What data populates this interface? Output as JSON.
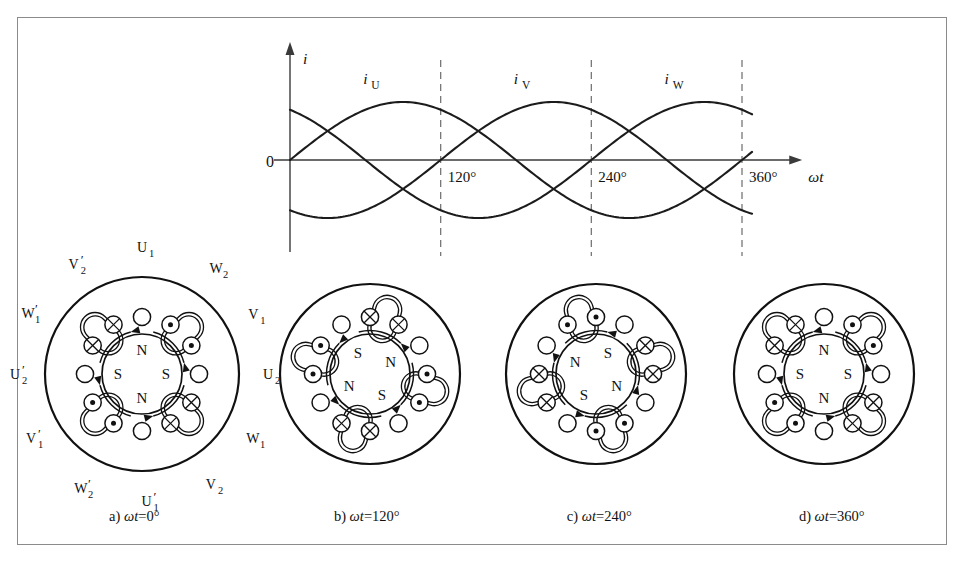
{
  "figure": {
    "border_color": "#8b8b8b",
    "background": "#ffffff"
  },
  "chart_data": {
    "type": "line",
    "title": "",
    "xlabel": "ωt",
    "ylabel": "i",
    "origin_label": "0",
    "xlim": [
      -30,
      390
    ],
    "ylim": [
      -1.25,
      1.25
    ],
    "grid": false,
    "legend": "inline-curve-labels",
    "xticks": [
      120,
      240,
      360
    ],
    "xtick_labels": [
      "120°",
      "240°",
      "360°"
    ],
    "dashed_verticals": [
      120,
      240,
      360
    ],
    "series": [
      {
        "name": "i_U",
        "label": "i",
        "label_sub": "U",
        "phase_deg": 0,
        "amplitude": 1,
        "label_at_deg": 60,
        "peak_deg": 90
      },
      {
        "name": "i_V",
        "label": "i",
        "label_sub": "V",
        "phase_deg": -120,
        "amplitude": 1,
        "label_at_deg": 180,
        "peak_deg": 210
      },
      {
        "name": "i_W",
        "label": "i",
        "label_sub": "W",
        "phase_deg": -240,
        "amplitude": 1,
        "label_at_deg": 300,
        "peak_deg": 330
      }
    ],
    "curve_start_values": {
      "i_U": 0.0,
      "i_V": 0.5,
      "i_W": -0.87
    }
  },
  "stators": [
    {
      "id": "a",
      "caption_prefix": "a)",
      "caption_var": "ωt",
      "caption_value": "=0°",
      "show_winding_labels": true,
      "poles": [
        {
          "letter": "N",
          "angle_deg": 90
        },
        {
          "letter": "S",
          "angle_deg": 180
        },
        {
          "letter": "N",
          "angle_deg": 270
        },
        {
          "letter": "S",
          "angle_deg": 0
        }
      ],
      "slots": [
        {
          "angle_deg": 90,
          "symbol": "none"
        },
        {
          "angle_deg": 60,
          "symbol": "dot"
        },
        {
          "angle_deg": 30,
          "symbol": "dot"
        },
        {
          "angle_deg": 0,
          "symbol": "none"
        },
        {
          "angle_deg": 330,
          "symbol": "cross"
        },
        {
          "angle_deg": 300,
          "symbol": "cross"
        },
        {
          "angle_deg": 270,
          "symbol": "none"
        },
        {
          "angle_deg": 240,
          "symbol": "dot"
        },
        {
          "angle_deg": 210,
          "symbol": "dot"
        },
        {
          "angle_deg": 180,
          "symbol": "none"
        },
        {
          "angle_deg": 150,
          "symbol": "cross"
        },
        {
          "angle_deg": 120,
          "symbol": "cross"
        }
      ],
      "coil_groups": [
        {
          "center_deg": 45
        },
        {
          "center_deg": 315
        },
        {
          "center_deg": 225
        },
        {
          "center_deg": 135
        }
      ],
      "flux_arcs": [
        {
          "start_deg": 105,
          "end_deg": 165
        },
        {
          "start_deg": 15,
          "end_deg": 75
        },
        {
          "start_deg": 285,
          "end_deg": 345
        },
        {
          "start_deg": 195,
          "end_deg": 255
        }
      ],
      "winding_labels": [
        {
          "text": "U",
          "sub": "1",
          "prime": false,
          "angle_deg": 90,
          "radius": 1.3
        },
        {
          "text": "W",
          "sub": "2",
          "prime": false,
          "angle_deg": 55,
          "radius": 1.33
        },
        {
          "text": "V",
          "sub": "1",
          "prime": false,
          "angle_deg": 28,
          "radius": 1.3
        },
        {
          "text": "U",
          "sub": "2",
          "prime": false,
          "angle_deg": 0,
          "radius": 1.3
        },
        {
          "text": "W",
          "sub": "1",
          "prime": false,
          "angle_deg": 330,
          "radius": 1.32
        },
        {
          "text": "V",
          "sub": "2",
          "prime": false,
          "angle_deg": 302,
          "radius": 1.34
        },
        {
          "text": "U",
          "sub": "1",
          "prime": true,
          "angle_deg": 272,
          "radius": 1.32
        },
        {
          "text": "W",
          "sub": "2",
          "prime": true,
          "angle_deg": 242,
          "radius": 1.34
        },
        {
          "text": "V",
          "sub": "1",
          "prime": true,
          "angle_deg": 210,
          "radius": 1.32
        },
        {
          "text": "U",
          "sub": "2",
          "prime": true,
          "angle_deg": 180,
          "radius": 1.31
        },
        {
          "text": "W",
          "sub": "1",
          "prime": true,
          "angle_deg": 152,
          "radius": 1.33
        },
        {
          "text": "V",
          "sub": "2",
          "prime": true,
          "angle_deg": 122,
          "radius": 1.33
        }
      ]
    },
    {
      "id": "b",
      "caption_prefix": "b)",
      "caption_var": "ωt",
      "caption_value": "=120°",
      "show_winding_labels": false,
      "poles": [
        {
          "letter": "S",
          "angle_deg": 120
        },
        {
          "letter": "N",
          "angle_deg": 30
        },
        {
          "letter": "S",
          "angle_deg": 300
        },
        {
          "letter": "N",
          "angle_deg": 210
        }
      ],
      "slots": [
        {
          "angle_deg": 90,
          "symbol": "cross"
        },
        {
          "angle_deg": 60,
          "symbol": "cross"
        },
        {
          "angle_deg": 30,
          "symbol": "none"
        },
        {
          "angle_deg": 0,
          "symbol": "dot"
        },
        {
          "angle_deg": 330,
          "symbol": "dot"
        },
        {
          "angle_deg": 300,
          "symbol": "none"
        },
        {
          "angle_deg": 270,
          "symbol": "cross"
        },
        {
          "angle_deg": 240,
          "symbol": "cross"
        },
        {
          "angle_deg": 210,
          "symbol": "none"
        },
        {
          "angle_deg": 180,
          "symbol": "dot"
        },
        {
          "angle_deg": 150,
          "symbol": "dot"
        },
        {
          "angle_deg": 120,
          "symbol": "none"
        }
      ],
      "coil_groups": [
        {
          "center_deg": 75
        },
        {
          "center_deg": 345
        },
        {
          "center_deg": 255
        },
        {
          "center_deg": 165
        }
      ],
      "flux_arcs": [
        {
          "start_deg": 135,
          "end_deg": 195
        },
        {
          "start_deg": 45,
          "end_deg": 105
        },
        {
          "start_deg": 315,
          "end_deg": 15
        },
        {
          "start_deg": 225,
          "end_deg": 285
        }
      ],
      "winding_labels": []
    },
    {
      "id": "c",
      "caption_prefix": "c)",
      "caption_var": "ωt",
      "caption_value": "=240°",
      "show_winding_labels": false,
      "poles": [
        {
          "letter": "N",
          "angle_deg": 150
        },
        {
          "letter": "S",
          "angle_deg": 60
        },
        {
          "letter": "N",
          "angle_deg": 330
        },
        {
          "letter": "S",
          "angle_deg": 240
        }
      ],
      "slots": [
        {
          "angle_deg": 90,
          "symbol": "dot"
        },
        {
          "angle_deg": 60,
          "symbol": "none"
        },
        {
          "angle_deg": 30,
          "symbol": "cross"
        },
        {
          "angle_deg": 0,
          "symbol": "cross"
        },
        {
          "angle_deg": 330,
          "symbol": "none"
        },
        {
          "angle_deg": 300,
          "symbol": "dot"
        },
        {
          "angle_deg": 270,
          "symbol": "dot"
        },
        {
          "angle_deg": 240,
          "symbol": "none"
        },
        {
          "angle_deg": 210,
          "symbol": "cross"
        },
        {
          "angle_deg": 180,
          "symbol": "cross"
        },
        {
          "angle_deg": 150,
          "symbol": "none"
        },
        {
          "angle_deg": 120,
          "symbol": "dot"
        }
      ],
      "coil_groups": [
        {
          "center_deg": 105
        },
        {
          "center_deg": 15
        },
        {
          "center_deg": 285
        },
        {
          "center_deg": 195
        }
      ],
      "flux_arcs": [
        {
          "start_deg": 165,
          "end_deg": 225
        },
        {
          "start_deg": 75,
          "end_deg": 135
        },
        {
          "start_deg": 345,
          "end_deg": 45
        },
        {
          "start_deg": 255,
          "end_deg": 315
        }
      ],
      "winding_labels": []
    },
    {
      "id": "d",
      "caption_prefix": "d)",
      "caption_var": "ωt",
      "caption_value": "=360°",
      "show_winding_labels": false,
      "poles": [
        {
          "letter": "N",
          "angle_deg": 90
        },
        {
          "letter": "S",
          "angle_deg": 180
        },
        {
          "letter": "N",
          "angle_deg": 270
        },
        {
          "letter": "S",
          "angle_deg": 0
        }
      ],
      "slots": [
        {
          "angle_deg": 90,
          "symbol": "none"
        },
        {
          "angle_deg": 60,
          "symbol": "dot"
        },
        {
          "angle_deg": 30,
          "symbol": "dot"
        },
        {
          "angle_deg": 0,
          "symbol": "none"
        },
        {
          "angle_deg": 330,
          "symbol": "cross"
        },
        {
          "angle_deg": 300,
          "symbol": "cross"
        },
        {
          "angle_deg": 270,
          "symbol": "none"
        },
        {
          "angle_deg": 240,
          "symbol": "dot"
        },
        {
          "angle_deg": 210,
          "symbol": "dot"
        },
        {
          "angle_deg": 180,
          "symbol": "none"
        },
        {
          "angle_deg": 150,
          "symbol": "cross"
        },
        {
          "angle_deg": 120,
          "symbol": "cross"
        }
      ],
      "coil_groups": [
        {
          "center_deg": 45
        },
        {
          "center_deg": 315
        },
        {
          "center_deg": 225
        },
        {
          "center_deg": 135
        }
      ],
      "flux_arcs": [
        {
          "start_deg": 105,
          "end_deg": 165
        },
        {
          "start_deg": 15,
          "end_deg": 75
        },
        {
          "start_deg": 285,
          "end_deg": 345
        },
        {
          "start_deg": 195,
          "end_deg": 255
        }
      ],
      "winding_labels": []
    }
  ]
}
